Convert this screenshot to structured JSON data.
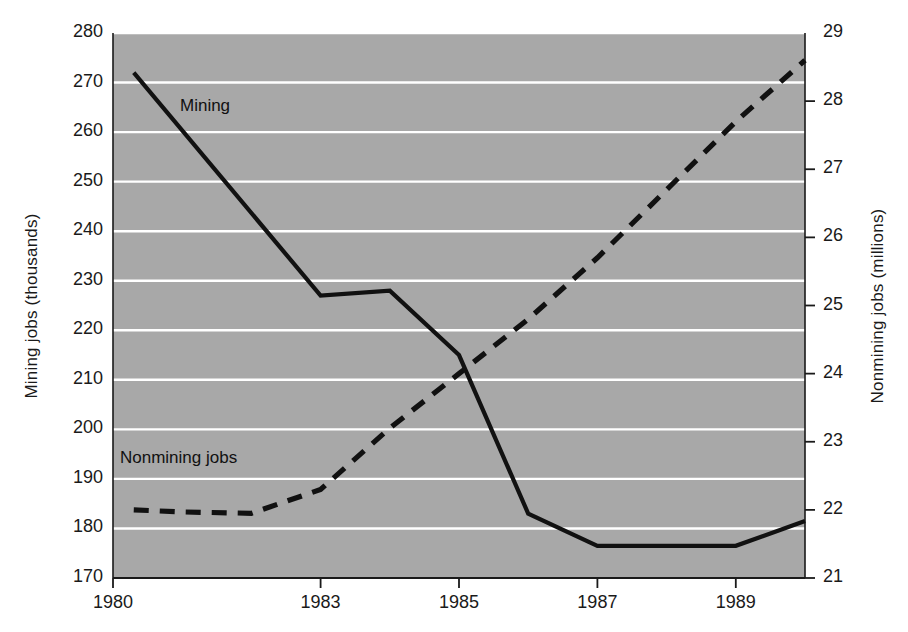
{
  "chart_data": {
    "type": "line",
    "title": "",
    "xlabel": "",
    "x": [
      1980.3,
      1981,
      1982,
      1983,
      1984,
      1985,
      1986,
      1987,
      1988,
      1989,
      1990
    ],
    "xlim": [
      1980,
      1990
    ],
    "x_ticks": [
      "1980",
      "1983",
      "1985",
      "1987",
      "1989"
    ],
    "x_tick_values": [
      1980,
      1983,
      1985,
      1987,
      1989
    ],
    "grid": true,
    "legend_position": "inline-annotations",
    "background_color": "#a8a8a8",
    "gridline_color": "#ffffff",
    "line_color": "#111111",
    "axes": [
      {
        "id": "left",
        "label": "Mining jobs (thousands)",
        "ylim": [
          170,
          280
        ],
        "ticks": [
          "170",
          "180",
          "190",
          "200",
          "210",
          "220",
          "230",
          "240",
          "250",
          "260",
          "270",
          "280"
        ],
        "tick_values": [
          170,
          180,
          190,
          200,
          210,
          220,
          230,
          240,
          250,
          260,
          270,
          280
        ]
      },
      {
        "id": "right",
        "label": "Nonmining jobs (millions)",
        "ylim": [
          21,
          29
        ],
        "ticks": [
          "21",
          "22",
          "23",
          "24",
          "25",
          "26",
          "27",
          "28",
          "29"
        ],
        "tick_values": [
          21,
          22,
          23,
          24,
          25,
          26,
          27,
          28,
          29
        ]
      }
    ],
    "series": [
      {
        "name": "Mining",
        "axis": "left",
        "style": "solid",
        "annotation": "Mining",
        "x": [
          1980.3,
          1983,
          1984,
          1985,
          1986,
          1987,
          1988,
          1989,
          1990
        ],
        "values": [
          272,
          227,
          228,
          215,
          183,
          176.5,
          176.5,
          176.5,
          181.5
        ]
      },
      {
        "name": "Nonmining jobs",
        "axis": "right",
        "style": "dashed",
        "annotation": "Nonmining jobs",
        "x": [
          1980.3,
          1981,
          1982,
          1983,
          1984,
          1985,
          1986,
          1987,
          1988,
          1989,
          1990
        ],
        "values": [
          22.0,
          21.97,
          21.95,
          22.3,
          23.2,
          24.0,
          24.8,
          25.7,
          26.7,
          27.7,
          28.6
        ]
      }
    ]
  }
}
